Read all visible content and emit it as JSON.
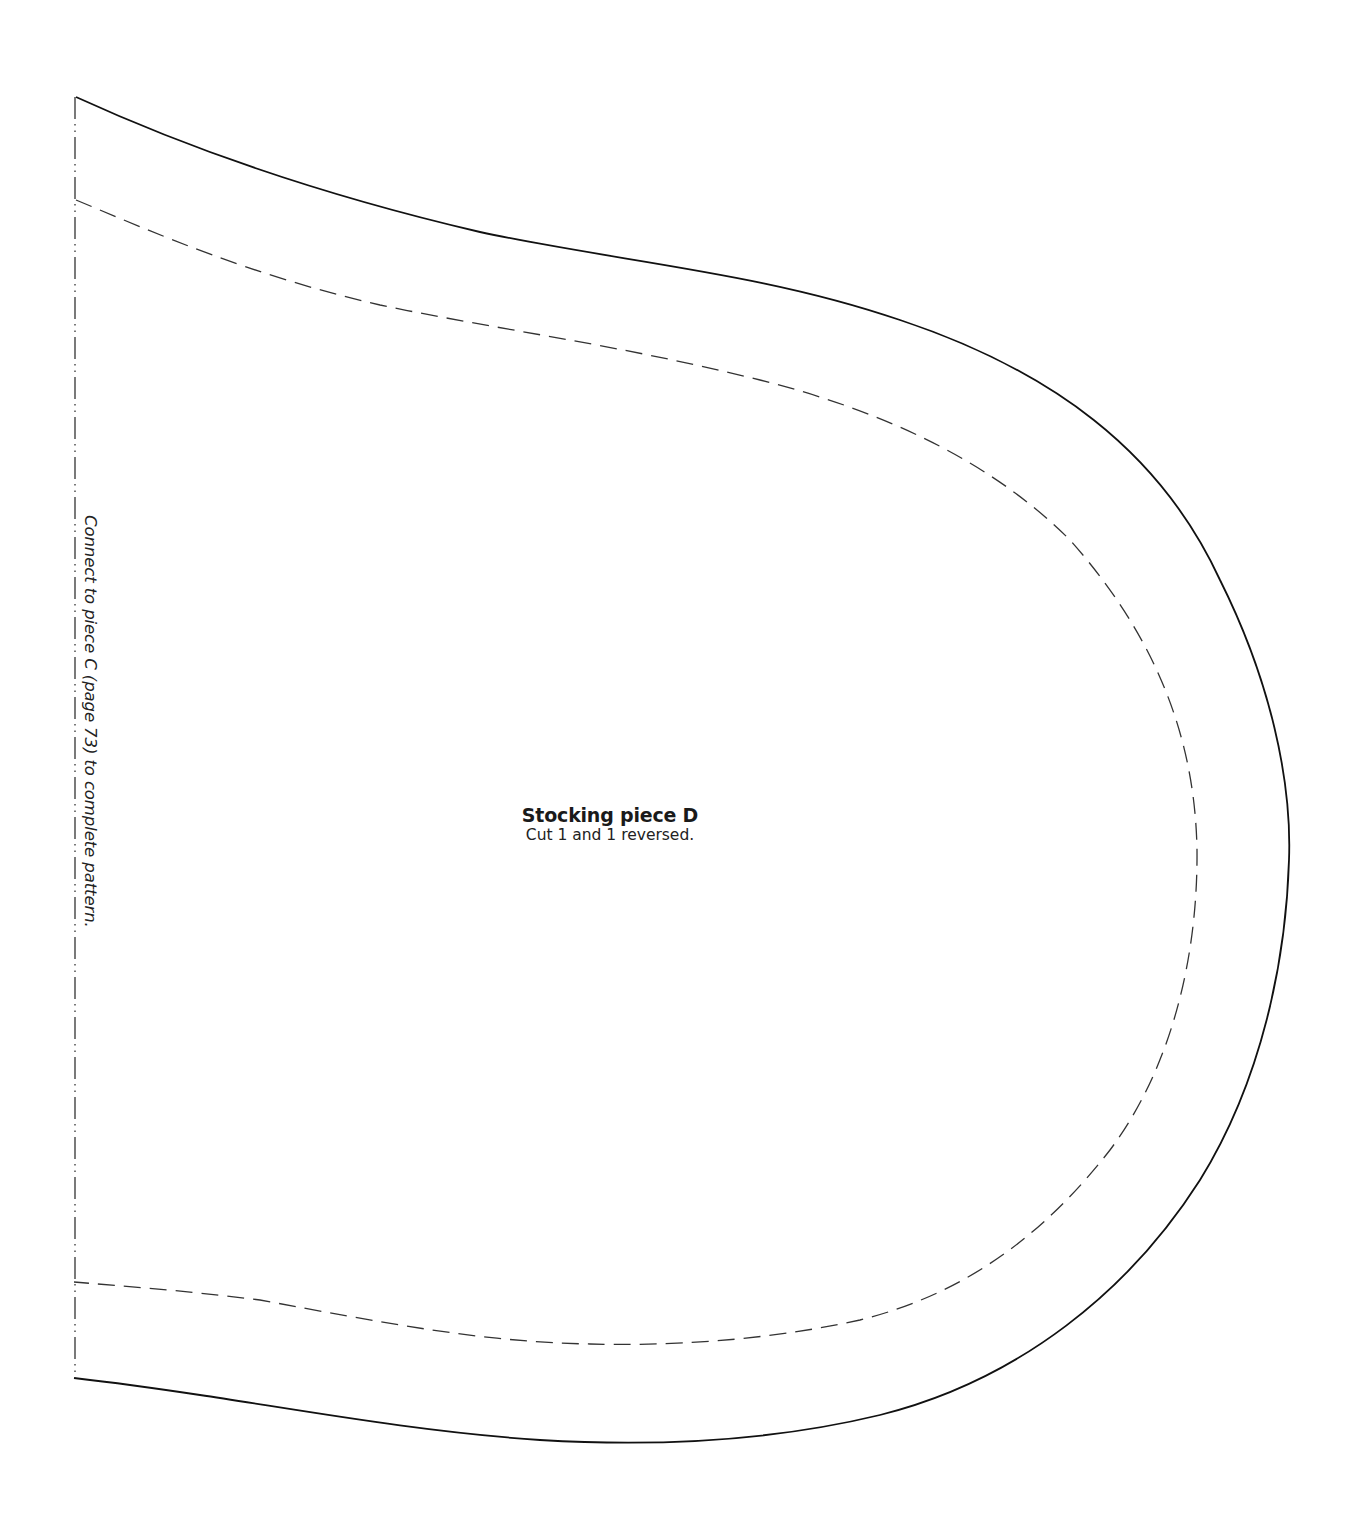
{
  "piece": {
    "title": "Stocking piece D",
    "instruction": "Cut 1 and 1 reversed."
  },
  "connect_note": "Connect to piece C (page 73) to complete pattern.",
  "lines": {
    "cut_line": {
      "style": "solid",
      "color": "#111111"
    },
    "seam_line": {
      "style": "dashed",
      "color": "#333333"
    },
    "fold_edge": {
      "style": "dash-dot-dot",
      "color": "#333333"
    }
  }
}
